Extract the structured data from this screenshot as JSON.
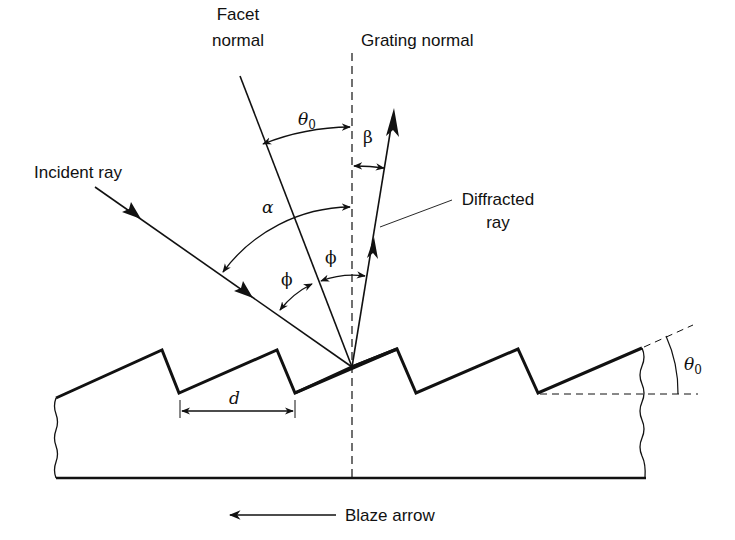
{
  "diagram": {
    "labels": {
      "facet_normal_line1": "Facet",
      "facet_normal_line2": "normal",
      "grating_normal": "Grating normal",
      "incident_ray": "Incident ray",
      "diffracted_ray_line1": "Diffracted",
      "diffracted_ray_line2": "ray",
      "blaze_arrow": "Blaze arrow"
    },
    "symbols": {
      "theta0_top": "θ",
      "theta0_top_sub": "0",
      "beta": "β",
      "alpha": "α",
      "phi_left": "ϕ",
      "phi_right": "ϕ",
      "d": "d",
      "theta0_right": "θ",
      "theta0_right_sub": "0"
    },
    "colors": {
      "stroke": "#111111",
      "background": "#ffffff"
    }
  }
}
